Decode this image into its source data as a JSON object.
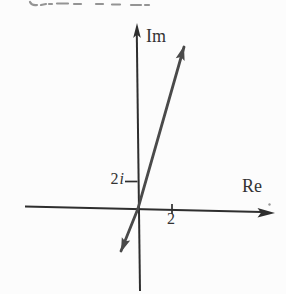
{
  "figure": {
    "labels": {
      "im_axis": "Im",
      "re_axis": "Re",
      "imag_tick_value": "2",
      "imag_tick_unit": "i",
      "real_tick": "2"
    },
    "colors": {
      "background": "#fcfcfc",
      "axis": "#2e2e2e",
      "vector": "#4a4a4a",
      "text": "#333333",
      "fragment": "#949494"
    }
  }
}
